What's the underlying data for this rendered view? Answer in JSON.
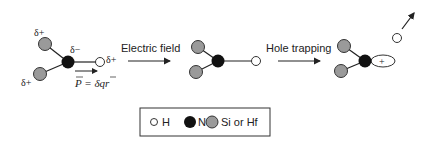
{
  "colors": {
    "hydrogen": "#ffffff",
    "nitrogen": "#111111",
    "si_hf": "#9a9a9a",
    "line": "#222222"
  },
  "molecule1": {
    "delta_plus_top": "δ+",
    "delta_plus_bottom": "δ+",
    "delta_plus_h": "δ+",
    "delta_minus_n": "δ−",
    "dipole_label": "P = δqr"
  },
  "steps": [
    {
      "label": "Electric field"
    },
    {
      "label": "Hole trapping"
    }
  ],
  "molecule3": {
    "hole_symbol": "+"
  },
  "legend": {
    "items": [
      {
        "symbol": "hydrogen",
        "label": "H"
      },
      {
        "symbol": "nitrogen",
        "label": "N"
      },
      {
        "symbol": "si_hf",
        "label": "Si or Hf"
      }
    ]
  }
}
